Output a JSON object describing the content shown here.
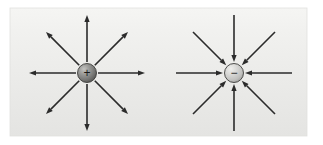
{
  "figure": {
    "background_color": "#ffffff",
    "panel": {
      "x": 10,
      "y": 8,
      "width": 297,
      "height": 128,
      "fill_top": "#f3f3f1",
      "fill_bottom": "#e6e6e4",
      "border_color": "#e0e0de"
    },
    "arrow_color": "#2b2b2b",
    "arrow_stroke_width": 1.6,
    "arrow_head_length": 7,
    "arrow_head_width": 5.2
  },
  "charges": [
    {
      "id": "positive-charge",
      "name": "positive point charge",
      "sign_label": "+",
      "sign_color": "#1a1a1a",
      "center_x": 87,
      "center_y": 73,
      "radius": 9.5,
      "fill_light": "#b9b9b7",
      "fill_mid": "#8e8e8c",
      "fill_dark": "#5d5d5b",
      "edge_color": "#3d3d3b",
      "field_direction": "outward",
      "arrow_inner_radius": 11,
      "arrow_outer_radius": 58,
      "arrow_count": 8,
      "arrow_angles_deg": [
        0,
        45,
        90,
        135,
        180,
        225,
        270,
        315
      ]
    },
    {
      "id": "negative-charge",
      "name": "negative point charge",
      "sign_label": "−",
      "sign_color": "#1a1a1a",
      "center_x": 234,
      "center_y": 73,
      "radius": 9.5,
      "fill_light": "#e4e4e2",
      "fill_mid": "#c9c9c7",
      "fill_dark": "#9d9d9b",
      "edge_color": "#3d3d3b",
      "field_direction": "inward",
      "arrow_inner_radius": 11,
      "arrow_outer_radius": 58,
      "arrow_count": 8,
      "arrow_angles_deg": [
        0,
        45,
        90,
        135,
        180,
        225,
        270,
        315
      ]
    }
  ],
  "chart_data": {
    "type": "diagram",
    "xlabel": "",
    "ylabel": "",
    "panels": [
      {
        "label": "positive charge",
        "sign": "+",
        "field_direction": "outward",
        "ray_count": 8,
        "ray_angles_deg": [
          0,
          45,
          90,
          135,
          180,
          225,
          270,
          315
        ]
      },
      {
        "label": "negative charge",
        "sign": "−",
        "field_direction": "inward",
        "ray_count": 8,
        "ray_angles_deg": [
          0,
          45,
          90,
          135,
          180,
          225,
          270,
          315
        ]
      }
    ]
  }
}
